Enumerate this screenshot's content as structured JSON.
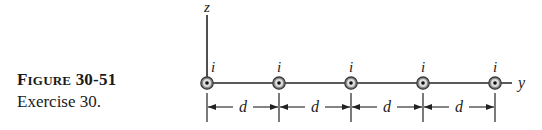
{
  "caption": {
    "figure_label_first": "F",
    "figure_label_rest": "IGURE",
    "figure_number": "30-51",
    "subtitle": "Exercise 30."
  },
  "diagram": {
    "axes": {
      "vertical": "z",
      "horizontal": "y"
    },
    "wire_current_label": "i",
    "wire_count": 5,
    "wire_direction": "out-of-page",
    "spacing_label": "d",
    "spacing_count": 4
  }
}
